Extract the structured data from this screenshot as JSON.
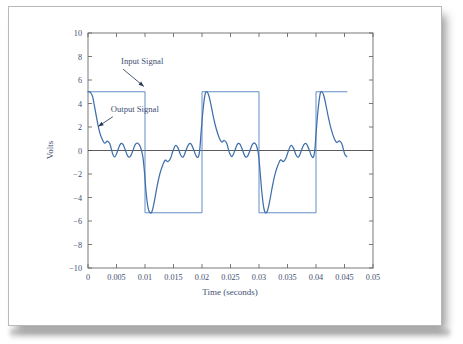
{
  "figure": {
    "paper_background": "#ffffff",
    "line_color_input": "#5b87c4",
    "line_color_output": "#3f6fab",
    "text_color": "#3f4f73",
    "axis_color": "#6a6a6a"
  },
  "annotations": {
    "input_label": "Input Signal",
    "output_label": "Output Signal"
  },
  "chart_data": {
    "type": "line",
    "title": "",
    "subtitle": "",
    "xlabel": "Time (seconds)",
    "ylabel": "Volts",
    "xlim": [
      0,
      0.05
    ],
    "ylim": [
      -10,
      10
    ],
    "grid": false,
    "legend": "annotated-inline",
    "legend_position": "inside-upper-left",
    "xticks": [
      0,
      0.005,
      0.01,
      0.015,
      0.02,
      0.025,
      0.03,
      0.035,
      0.04,
      0.045,
      0.05
    ],
    "xtick_labels": [
      "0",
      "0.005",
      "0.01",
      "0.015",
      "0.02",
      "0.025",
      "0.03",
      "0.035",
      "0.04",
      "0.045",
      "0.05"
    ],
    "yticks": [
      -10,
      -8,
      -6,
      -4,
      -2,
      0,
      2,
      4,
      6,
      8,
      10
    ],
    "ytick_labels": [
      "-10",
      "-8",
      "-6",
      "-4",
      "-2",
      "0",
      "2",
      "4",
      "6",
      "8",
      "10"
    ],
    "zero_line": 0,
    "series": [
      {
        "name": "Input Signal",
        "kind": "square-wave",
        "amplitude": 5,
        "period": 0.02,
        "duty": 0.5,
        "starts_high": true,
        "t_end": 0.0455,
        "points": [
          [
            0.0,
            5.0
          ],
          [
            0.01,
            5.0
          ],
          [
            0.01,
            -5.3
          ],
          [
            0.02,
            -5.3
          ],
          [
            0.02,
            5.0
          ],
          [
            0.03,
            5.0
          ],
          [
            0.03,
            -5.3
          ],
          [
            0.04,
            -5.3
          ],
          [
            0.04,
            5.0
          ],
          [
            0.0455,
            5.0
          ]
        ]
      },
      {
        "name": "Output Signal",
        "kind": "ringing-response",
        "description": "Band-limited / filtered square wave with overshoot spikes at each transition and damped Gibbs ringing between transitions",
        "points": [
          [
            0.0,
            5.0
          ],
          [
            0.0004,
            4.95
          ],
          [
            0.0008,
            4.6
          ],
          [
            0.0012,
            3.6
          ],
          [
            0.0016,
            2.55
          ],
          [
            0.00205,
            1.55
          ],
          [
            0.0025,
            0.95
          ],
          [
            0.00295,
            0.62
          ],
          [
            0.0034,
            0.8
          ],
          [
            0.00385,
            0.55
          ],
          [
            0.0043,
            -0.25
          ],
          [
            0.0047,
            -0.55
          ],
          [
            0.00515,
            -0.1
          ],
          [
            0.0056,
            0.48
          ],
          [
            0.00605,
            0.58
          ],
          [
            0.0065,
            0.1
          ],
          [
            0.00695,
            -0.45
          ],
          [
            0.0074,
            -0.52
          ],
          [
            0.00785,
            -0.05
          ],
          [
            0.0083,
            0.52
          ],
          [
            0.00875,
            0.62
          ],
          [
            0.0092,
            0.3
          ],
          [
            0.0096,
            -0.45
          ],
          [
            0.0099,
            -1.8
          ],
          [
            0.0102,
            -3.6
          ],
          [
            0.01055,
            -4.9
          ],
          [
            0.0109,
            -5.3
          ],
          [
            0.01125,
            -5.15
          ],
          [
            0.01165,
            -4.3
          ],
          [
            0.0121,
            -3.1
          ],
          [
            0.0126,
            -2.0
          ],
          [
            0.0131,
            -1.25
          ],
          [
            0.01355,
            -0.82
          ],
          [
            0.014,
            -0.95
          ],
          [
            0.01445,
            -0.7
          ],
          [
            0.0149,
            -0.05
          ],
          [
            0.01535,
            0.42
          ],
          [
            0.0158,
            0.2
          ],
          [
            0.01625,
            -0.38
          ],
          [
            0.0167,
            -0.55
          ],
          [
            0.01715,
            -0.05
          ],
          [
            0.0176,
            0.48
          ],
          [
            0.01805,
            0.58
          ],
          [
            0.0185,
            0.12
          ],
          [
            0.01895,
            -0.45
          ],
          [
            0.01935,
            -0.55
          ],
          [
            0.0196,
            0.05
          ],
          [
            0.01985,
            1.6
          ],
          [
            0.02015,
            3.3
          ],
          [
            0.0205,
            4.7
          ],
          [
            0.0208,
            5.0
          ],
          [
            0.02115,
            4.75
          ],
          [
            0.02155,
            3.95
          ],
          [
            0.022,
            2.85
          ],
          [
            0.0225,
            1.85
          ],
          [
            0.023,
            1.1
          ],
          [
            0.02345,
            0.72
          ],
          [
            0.0239,
            0.85
          ],
          [
            0.02435,
            0.6
          ],
          [
            0.0248,
            -0.18
          ],
          [
            0.02525,
            -0.52
          ],
          [
            0.0257,
            -0.08
          ],
          [
            0.02615,
            0.48
          ],
          [
            0.0266,
            0.58
          ],
          [
            0.02705,
            0.12
          ],
          [
            0.0275,
            -0.45
          ],
          [
            0.02795,
            -0.52
          ],
          [
            0.0284,
            -0.02
          ],
          [
            0.02885,
            0.52
          ],
          [
            0.0293,
            0.62
          ],
          [
            0.02965,
            0.28
          ],
          [
            0.02995,
            -0.5
          ],
          [
            0.0302,
            -1.85
          ],
          [
            0.0305,
            -3.55
          ],
          [
            0.03085,
            -4.9
          ],
          [
            0.03115,
            -5.3
          ],
          [
            0.0315,
            -5.1
          ],
          [
            0.0319,
            -4.25
          ],
          [
            0.03235,
            -3.05
          ],
          [
            0.03285,
            -1.95
          ],
          [
            0.03335,
            -1.22
          ],
          [
            0.0338,
            -0.8
          ],
          [
            0.03425,
            -0.95
          ],
          [
            0.0347,
            -0.68
          ],
          [
            0.03515,
            -0.05
          ],
          [
            0.0356,
            0.42
          ],
          [
            0.03605,
            0.2
          ],
          [
            0.0365,
            -0.38
          ],
          [
            0.03695,
            -0.55
          ],
          [
            0.0374,
            -0.05
          ],
          [
            0.03785,
            0.48
          ],
          [
            0.0383,
            0.58
          ],
          [
            0.03875,
            0.12
          ],
          [
            0.0392,
            -0.45
          ],
          [
            0.03955,
            -0.55
          ],
          [
            0.0398,
            0.1
          ],
          [
            0.04005,
            1.7
          ],
          [
            0.04035,
            3.4
          ],
          [
            0.0407,
            4.75
          ],
          [
            0.041,
            5.0
          ],
          [
            0.04135,
            4.7
          ],
          [
            0.04175,
            3.85
          ],
          [
            0.0422,
            2.75
          ],
          [
            0.0427,
            1.75
          ],
          [
            0.0432,
            1.02
          ],
          [
            0.04365,
            0.68
          ],
          [
            0.0441,
            0.82
          ],
          [
            0.04455,
            0.55
          ],
          [
            0.045,
            -0.25
          ],
          [
            0.0454,
            -0.52
          ]
        ]
      }
    ],
    "annotations": [
      {
        "text": "Input Signal",
        "text_x": 0.0058,
        "text_y": 7.35,
        "arrow_to_x": 0.0098,
        "arrow_to_y": 5.45,
        "target_series": "Input Signal"
      },
      {
        "text": "Output Signal",
        "text_x": 0.004,
        "text_y": 3.3,
        "arrow_to_x": 0.0018,
        "arrow_to_y": 2.05,
        "target_series": "Output Signal"
      }
    ]
  }
}
